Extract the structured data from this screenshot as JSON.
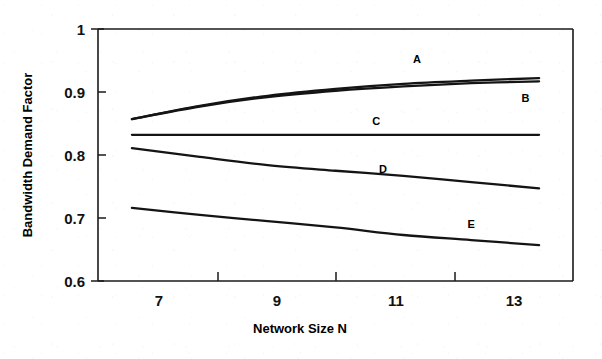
{
  "chart_data": {
    "type": "line",
    "title": "",
    "xlabel": "Network Size N",
    "ylabel": "Bandwidth Demand Factor",
    "xlim": [
      6.5,
      13.5
    ],
    "ylim": [
      0.6,
      1.0
    ],
    "x_ticks": [
      7,
      9,
      11,
      13
    ],
    "x_tick_labels": [
      "7",
      "9",
      "11",
      "13"
    ],
    "x_minor_ticks": [
      8,
      10,
      12
    ],
    "y_ticks": [
      0.6,
      0.7,
      0.8,
      0.9,
      1.0
    ],
    "y_tick_labels": [
      "0.6",
      "0.7",
      "0.8",
      "0.9",
      "1"
    ],
    "grid": false,
    "legend": "inline-annotations",
    "x": [
      7,
      8,
      9,
      10,
      11,
      12,
      13
    ],
    "series": [
      {
        "name": "A",
        "label": "A",
        "values": [
          0.857,
          0.878,
          0.894,
          0.905,
          0.913,
          0.918,
          0.922
        ],
        "color": "#141414"
      },
      {
        "name": "B",
        "label": "B",
        "values": [
          0.857,
          0.877,
          0.892,
          0.902,
          0.909,
          0.914,
          0.917
        ],
        "color": "#141414"
      },
      {
        "name": "C",
        "label": "C",
        "values": [
          0.832,
          0.832,
          0.832,
          0.832,
          0.832,
          0.832,
          0.832
        ],
        "color": "#141414"
      },
      {
        "name": "D",
        "label": "D",
        "values": [
          0.811,
          0.797,
          0.784,
          0.775,
          0.767,
          0.757,
          0.747
        ],
        "color": "#141414"
      },
      {
        "name": "E",
        "label": "E",
        "values": [
          0.716,
          0.705,
          0.695,
          0.685,
          0.673,
          0.665,
          0.657
        ],
        "color": "#141414"
      }
    ],
    "annotations": [
      {
        "text": "A",
        "x": 11.2,
        "y": 0.946
      },
      {
        "text": "B",
        "x": 12.8,
        "y": 0.884
      },
      {
        "text": "C",
        "x": 10.6,
        "y": 0.848
      },
      {
        "text": "D",
        "x": 10.7,
        "y": 0.772
      },
      {
        "text": "E",
        "x": 12.0,
        "y": 0.684
      }
    ]
  },
  "axes": {
    "y_title": "Bandwidth Demand Factor",
    "x_title": "Network Size N",
    "y_labels": [
      "1",
      "0.9",
      "0.8",
      "0.7",
      "0.6"
    ],
    "x_labels": [
      "7",
      "9",
      "11",
      "13"
    ]
  },
  "colors": {
    "background": "#ffffff",
    "ink": "#141414",
    "frame": "#1a1a1a"
  }
}
